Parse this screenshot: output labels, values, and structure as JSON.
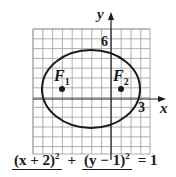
{
  "diagram": {
    "axes": {
      "x_label": "x",
      "y_label": "y"
    },
    "tick_labels": {
      "y_top": "6",
      "x_right": "3"
    },
    "foci": [
      {
        "name": "F",
        "sub": "1",
        "x": -4,
        "y": 1
      },
      {
        "name": "F",
        "sub": "2",
        "x": 0,
        "y": 1
      }
    ],
    "ellipse": {
      "center": [
        -2,
        1
      ],
      "a": 5,
      "b": 4
    },
    "grid": {
      "x_range": [
        -8,
        4
      ],
      "y_range": [
        -5,
        7
      ]
    },
    "colors": {
      "line": "#1a1a1a",
      "grid": "#9a9a9a"
    }
  },
  "equation": {
    "num1": "(x + 2)",
    "exp1": "2",
    "plus": "+",
    "num2": "(y − 1)",
    "exp2": "2",
    "equals": "= 1"
  }
}
